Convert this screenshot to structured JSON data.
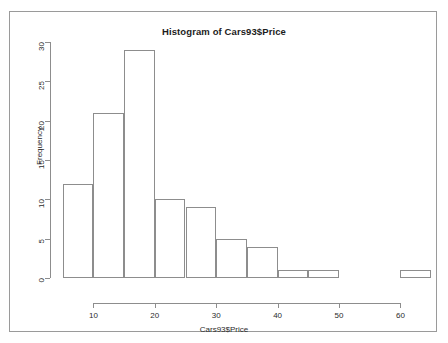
{
  "chart_data": {
    "type": "bar",
    "title": "Histogram of Cars93$Price",
    "xlabel": "Cars93$Price",
    "ylabel": "Frequency",
    "binwidth": 5,
    "bin_edges": [
      5,
      10,
      15,
      20,
      25,
      30,
      35,
      40,
      45,
      50,
      55,
      60,
      65
    ],
    "categories": [
      "5-10",
      "10-15",
      "15-20",
      "20-25",
      "25-30",
      "30-35",
      "35-40",
      "40-45",
      "45-50",
      "50-55",
      "55-60",
      "60-65"
    ],
    "values": [
      12,
      21,
      29,
      10,
      9,
      5,
      4,
      1,
      1,
      0,
      0,
      1
    ],
    "xlim": [
      5,
      65
    ],
    "ylim": [
      0,
      30
    ],
    "xticks": [
      10,
      20,
      30,
      40,
      50,
      60
    ],
    "xtick_labels": [
      "10",
      "20",
      "30",
      "40",
      "50",
      "60"
    ],
    "yticks": [
      0,
      5,
      10,
      15,
      20,
      25,
      30
    ],
    "ytick_labels": [
      "0",
      "5",
      "10",
      "15",
      "20",
      "25",
      "30"
    ],
    "grid": false,
    "legend": false,
    "bar_fill": "transparent",
    "bar_border": "#8d8d8d",
    "axis_color": "#8d8d8d",
    "background": "#ffffff",
    "frame_border": "#9a9a9a"
  }
}
